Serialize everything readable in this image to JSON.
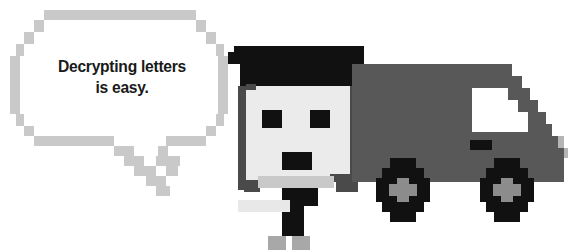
{
  "scene": {
    "title": "Pixel-art courier and delivery truck illustration",
    "width": 584,
    "height": 252,
    "background_color": "#ffffff"
  },
  "speech_bubble": {
    "name": "speech-bubble",
    "border_color": "#c9c9c9",
    "fill_color": "#ffffff",
    "text_color": "#1a1a1a",
    "lines": [
      "Decrypting letters",
      "is easy."
    ],
    "line1": "Decrypting letters",
    "line2": "is easy.",
    "full_text": "Decrypting letters is easy.",
    "tail_direction": "down-right"
  },
  "character": {
    "name": "courier-character",
    "hat_color": "#111111",
    "face_color": "#ebebeb",
    "shadow_color": "#4a4a4a",
    "eye_color": "#111111",
    "mouth_color": "#111111",
    "body_color": "#111111",
    "arm_color": "#e8e8e8",
    "feet_color": "#a8a8a8",
    "parts": [
      "hat",
      "face",
      "left-eye",
      "right-eye",
      "mouth",
      "collar",
      "arm",
      "body",
      "left-foot",
      "right-foot"
    ]
  },
  "truck": {
    "name": "delivery-truck",
    "body_color": "#585858",
    "window_color": "#ffffff",
    "handle_color": "#111111",
    "wheel_color": "#111111",
    "hub_color": "#8c8c8c",
    "wheel_count": 2,
    "parts": [
      "cargo-box",
      "cab-window",
      "door-handle",
      "rear-slope",
      "front-wheel",
      "rear-wheel"
    ]
  },
  "palette": {
    "black": "#111111",
    "dark_gray": "#4a4a4a",
    "truck_gray": "#585858",
    "mid_gray": "#8c8c8c",
    "light_gray": "#a8a8a8",
    "bubble_border": "#c9c9c9",
    "off_white": "#ebebeb",
    "white": "#ffffff"
  }
}
